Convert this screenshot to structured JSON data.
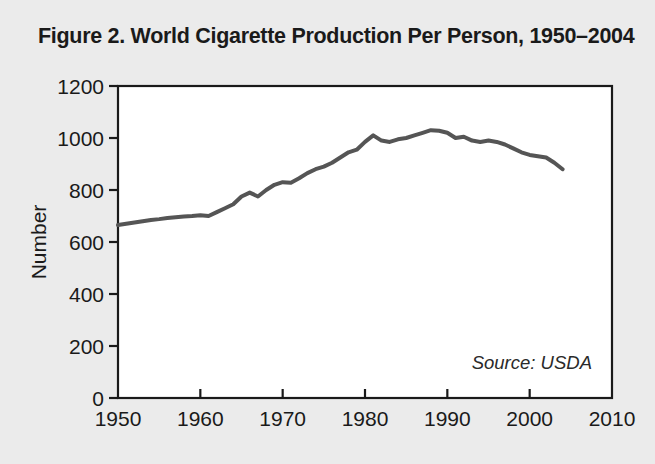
{
  "figure": {
    "title": "Figure 2. World Cigarette Production Per Person, 1950–2004",
    "source_note": "Source: USDA",
    "background_color": "#ebebeb",
    "line_color": "#555555",
    "axis_color": "#1a1a1a",
    "text_color": "#1a1a1a"
  },
  "chart_data": {
    "type": "line",
    "title": "Figure 2. World Cigarette Production Per Person, 1950–2004",
    "xlabel": "",
    "ylabel": "Number",
    "xlim": [
      1950,
      2010
    ],
    "ylim": [
      0,
      1200
    ],
    "xticks": [
      1950,
      1960,
      1970,
      1980,
      1990,
      2000,
      2010
    ],
    "xtick_labels": [
      "1950",
      "1960",
      "1970",
      "1980",
      "1990",
      "2000",
      "2010"
    ],
    "yticks": [
      0,
      200,
      400,
      600,
      800,
      1000,
      1200
    ],
    "ytick_labels": [
      "0",
      "200",
      "400",
      "600",
      "800",
      "1000",
      "1200"
    ],
    "grid": false,
    "legend": null,
    "annotations": [
      {
        "text": "Source: USDA",
        "x": 2000,
        "y": 185,
        "style": "italic"
      }
    ],
    "series": [
      {
        "name": "World Cigarette Production Per Person",
        "color": "#555555",
        "x": [
          1950,
          1951,
          1952,
          1953,
          1954,
          1955,
          1956,
          1957,
          1958,
          1959,
          1960,
          1961,
          1962,
          1963,
          1964,
          1965,
          1966,
          1967,
          1968,
          1969,
          1970,
          1971,
          1972,
          1973,
          1974,
          1975,
          1976,
          1977,
          1978,
          1979,
          1980,
          1981,
          1982,
          1983,
          1984,
          1985,
          1986,
          1987,
          1988,
          1989,
          1990,
          1991,
          1992,
          1993,
          1994,
          1995,
          1996,
          1997,
          1998,
          1999,
          2000,
          2001,
          2002,
          2003,
          2004
        ],
        "values": [
          665,
          670,
          675,
          680,
          685,
          688,
          692,
          695,
          698,
          700,
          703,
          700,
          715,
          730,
          745,
          775,
          790,
          775,
          800,
          820,
          830,
          828,
          845,
          865,
          880,
          890,
          905,
          925,
          945,
          955,
          985,
          1010,
          990,
          985,
          995,
          1000,
          1010,
          1020,
          1030,
          1028,
          1020,
          1000,
          1005,
          990,
          985,
          990,
          985,
          975,
          960,
          945,
          935,
          930,
          925,
          905,
          880
        ]
      }
    ]
  }
}
